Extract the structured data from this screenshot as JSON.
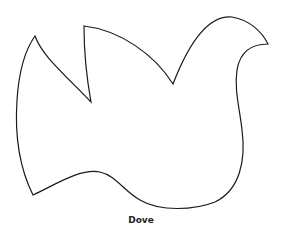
{
  "figure": {
    "label": "Dove",
    "stroke_color": "#1a1a1a",
    "fill_color": "#ffffff"
  }
}
